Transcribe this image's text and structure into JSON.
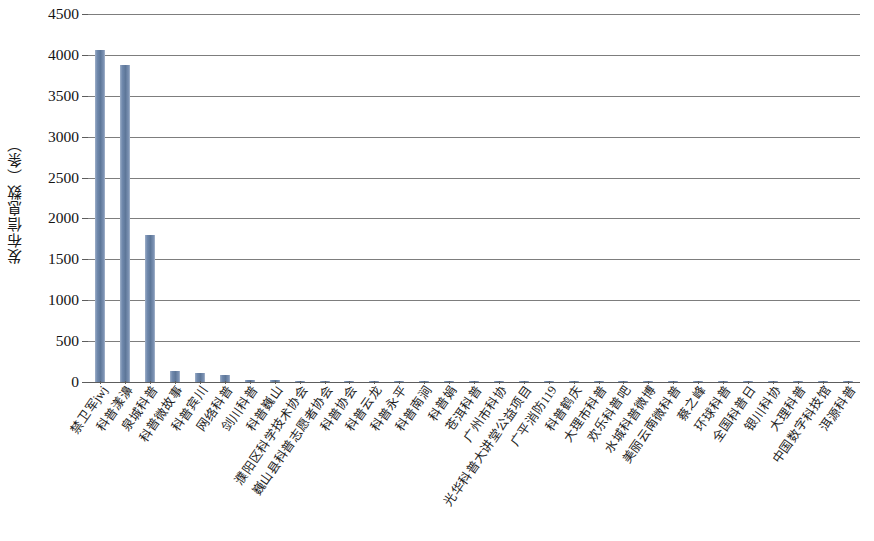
{
  "chart_data": {
    "type": "bar",
    "title": "",
    "subtitle": "",
    "xlabel": "",
    "ylabel": "发布信息数（条）",
    "ylim": [
      0,
      4500
    ],
    "ytick_values": [
      0,
      500,
      1000,
      1500,
      2000,
      2500,
      3000,
      3500,
      4000,
      4500
    ],
    "ytick_labels": [
      "0",
      "500",
      "1000",
      "1500",
      "2000",
      "2500",
      "3000",
      "3500",
      "4000",
      "4500"
    ],
    "grid": true,
    "legend": null,
    "legend_position": "none",
    "bar_color": "#6b83a8",
    "categories": [
      "禁卫军jwj",
      "科普漾濞",
      "泉城科普",
      "科普微故事",
      "科普宾川",
      "网络科普",
      "剑川科普",
      "科普巍山",
      "濮阳区科学技术协会",
      "巍山县科普志愿者协会",
      "科普协会",
      "科普云龙",
      "科普永平",
      "科普南涧",
      "科普娟",
      "苍洱科普",
      "广州市科协",
      "光华科普大讲堂公益项目",
      "广平消防119",
      "科普鹤庆",
      "大理市科普",
      "欢乐科普吧",
      "水城科普微博",
      "美丽云南微科普",
      "蔡之峰",
      "环球科普",
      "全国科普日",
      "银川科协",
      "大理科普",
      "中国数字科技馆",
      "洱源科普"
    ],
    "values": [
      4060,
      3880,
      1800,
      140,
      105,
      85,
      28,
      24,
      18,
      16,
      12,
      11,
      10,
      10,
      9,
      9,
      8,
      8,
      7,
      7,
      6,
      6,
      5,
      5,
      5,
      4,
      4,
      3,
      3,
      2,
      2
    ]
  }
}
